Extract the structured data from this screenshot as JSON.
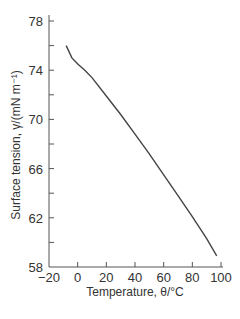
{
  "chart_data": {
    "type": "line",
    "title": "",
    "xlabel": "Temperature, θ/°C",
    "ylabel": "Surface tension, γ/(mN m⁻¹)",
    "xlim": [
      -20,
      100
    ],
    "ylim": [
      58,
      78
    ],
    "x_ticks": [
      -20,
      0,
      20,
      40,
      60,
      80,
      100
    ],
    "x_tick_labels": [
      "−20",
      "0",
      "20",
      "40",
      "60",
      "80",
      "100"
    ],
    "y_ticks": [
      58,
      60,
      62,
      64,
      66,
      68,
      70,
      72,
      74,
      76,
      78
    ],
    "y_tick_labels": [
      "58",
      "",
      "62",
      "",
      "66",
      "",
      "70",
      "",
      "74",
      "",
      "78"
    ],
    "grid": false,
    "legend": null,
    "series": [
      {
        "name": "Surface tension of water",
        "color": "#444444",
        "x": [
          -8,
          -4,
          0,
          5,
          10,
          20,
          30,
          40,
          50,
          60,
          70,
          80,
          90,
          97
        ],
        "y": [
          76.0,
          75.0,
          74.5,
          74.0,
          73.4,
          71.9,
          70.4,
          68.8,
          67.2,
          65.5,
          63.8,
          62.1,
          60.3,
          58.9
        ]
      }
    ]
  }
}
